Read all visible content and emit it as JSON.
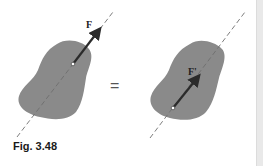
{
  "figure": {
    "caption": "Fig. 3.48",
    "left_panel": {
      "force_label": "F",
      "description": "Rigid body with force F applied at a point, acting along its dashed line of action"
    },
    "operator": "=",
    "right_panel": {
      "force_label": "F'",
      "description": "Same rigid body with equivalent force F' applied at a different point along the same line of action"
    },
    "colors": {
      "body_fill": "#8a8a8a",
      "arrow": "#2b2b2b",
      "line_of_action": "#6e6e6e",
      "application_point": "#ffffff",
      "sidebar": "#e9e9e9"
    }
  }
}
